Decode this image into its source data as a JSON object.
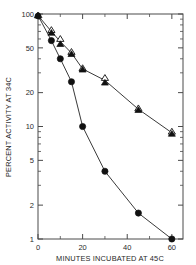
{
  "chart_data": {
    "type": "line",
    "title": "",
    "xlabel": "MINUTES INCUBATED AT 45C",
    "ylabel": "PERCENT ACTIVITY AT 34C",
    "xlim": [
      0,
      65
    ],
    "ylim": [
      1,
      100
    ],
    "yscale": "log",
    "xscale": "linear",
    "grid": false,
    "legend": "none",
    "xticks": [
      0,
      20,
      40,
      60
    ],
    "xticklabels": [
      "0",
      "20",
      "40",
      "60"
    ],
    "xticks_minor": [
      10,
      30,
      50
    ],
    "yticks": [
      1,
      2,
      5,
      10,
      20,
      50,
      100
    ],
    "yticklabels": [
      "1",
      "2",
      "5",
      "10",
      "20",
      "50",
      "100"
    ],
    "series": [
      {
        "name": "open-triangle-series",
        "marker": "open-triangle",
        "x": [
          0,
          6,
          10,
          15,
          20,
          30,
          45,
          60
        ],
        "y": [
          97,
          72,
          60,
          46,
          33,
          27,
          14.5,
          9.0
        ]
      },
      {
        "name": "filled-triangle-series",
        "marker": "filled-triangle",
        "x": [
          0,
          6,
          10,
          15,
          20,
          30,
          45,
          60
        ],
        "y": [
          97,
          68,
          54,
          44,
          32,
          24.5,
          14.0,
          8.6
        ]
      },
      {
        "name": "filled-circle-series",
        "marker": "filled-circle",
        "x": [
          0,
          6,
          10,
          15,
          20,
          30,
          45,
          60
        ],
        "y": [
          97,
          58,
          40,
          25,
          10,
          4.0,
          1.7,
          1.0
        ]
      }
    ]
  },
  "colors": {
    "axis": "#4a4a4a",
    "curve": "#3a3a3a",
    "marker_fill": "#111111",
    "marker_open": "#ffffff",
    "text": "#1f1f1f",
    "background": "#ffffff"
  }
}
